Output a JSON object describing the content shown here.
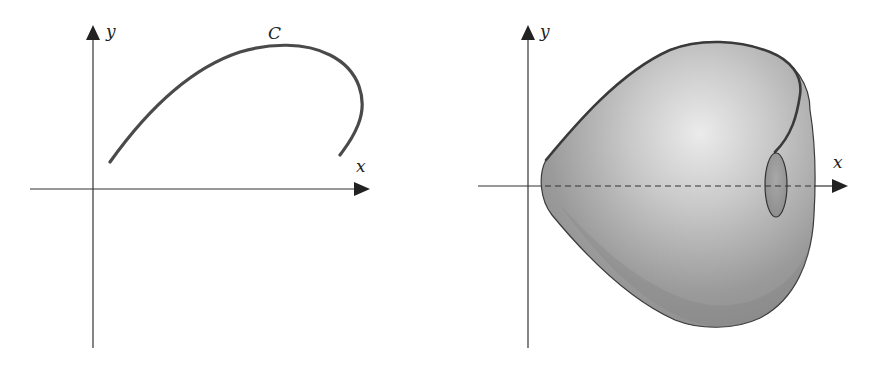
{
  "left_figure": {
    "axis_labels": {
      "x": "x",
      "y": "y"
    },
    "curve_label": "C"
  },
  "right_figure": {
    "axis_labels": {
      "x": "x",
      "y": "y"
    }
  },
  "colors": {
    "axis": "#333333",
    "curve": "#4a4a4a",
    "solid_light": "#e8e8e8",
    "solid_dark": "#8a8a8a",
    "background": "#ffffff"
  }
}
